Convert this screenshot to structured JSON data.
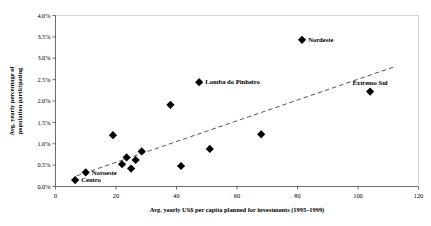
{
  "chart_data": {
    "type": "scatter",
    "title": "",
    "xlabel": "Avg. yearly US$ per capita planned for investments (1995–1999)",
    "ylabel_line1": "Avg. yearly percentage of",
    "ylabel_line2": "population participating",
    "xlim": [
      0,
      120
    ],
    "ylim": [
      0,
      4
    ],
    "xticks": [
      "0",
      "20",
      "40",
      "60",
      "80",
      "100",
      "120"
    ],
    "xtick_values": [
      0,
      20,
      40,
      60,
      80,
      100,
      120
    ],
    "yticks": [
      "0.0%",
      "0.5%",
      "1.0%",
      "1.5%",
      "2.0%",
      "2.5%",
      "3.0%",
      "3.5%",
      "4.0%"
    ],
    "ytick_values": [
      0,
      0.5,
      1.0,
      1.5,
      2.0,
      2.5,
      3.0,
      3.5,
      4.0
    ],
    "grid": false,
    "legend": "none",
    "marker": "diamond",
    "marker_color": "#000000",
    "points": [
      {
        "x": 6.5,
        "y": 0.15,
        "label": "Centro",
        "label_pos": "right"
      },
      {
        "x": 10.0,
        "y": 0.33,
        "label": "Noroeste",
        "label_pos": "right"
      },
      {
        "x": 19.0,
        "y": 1.2,
        "label": "",
        "label_pos": "right"
      },
      {
        "x": 22.0,
        "y": 0.52,
        "label": "",
        "label_pos": "right"
      },
      {
        "x": 23.5,
        "y": 0.68,
        "label": "",
        "label_pos": "right"
      },
      {
        "x": 25.0,
        "y": 0.42,
        "label": "",
        "label_pos": "right"
      },
      {
        "x": 26.5,
        "y": 0.62,
        "label": "",
        "label_pos": "right"
      },
      {
        "x": 28.5,
        "y": 0.82,
        "label": "",
        "label_pos": "right"
      },
      {
        "x": 38.0,
        "y": 1.91,
        "label": "",
        "label_pos": "right"
      },
      {
        "x": 41.5,
        "y": 0.48,
        "label": "",
        "label_pos": "right"
      },
      {
        "x": 47.5,
        "y": 2.44,
        "label": "Lomba do Pinheiro",
        "label_pos": "right"
      },
      {
        "x": 51.0,
        "y": 0.88,
        "label": "",
        "label_pos": "right"
      },
      {
        "x": 68.0,
        "y": 1.22,
        "label": "",
        "label_pos": "right"
      },
      {
        "x": 81.5,
        "y": 3.43,
        "label": "Nordeste",
        "label_pos": "right"
      },
      {
        "x": 104.0,
        "y": 2.22,
        "label": "Extremo Sul",
        "label_pos": "above"
      }
    ],
    "trendline": {
      "style": "dashed",
      "color": "#555555",
      "x1": 7.0,
      "y1": 0.25,
      "x2": 112.0,
      "y2": 2.8
    }
  }
}
